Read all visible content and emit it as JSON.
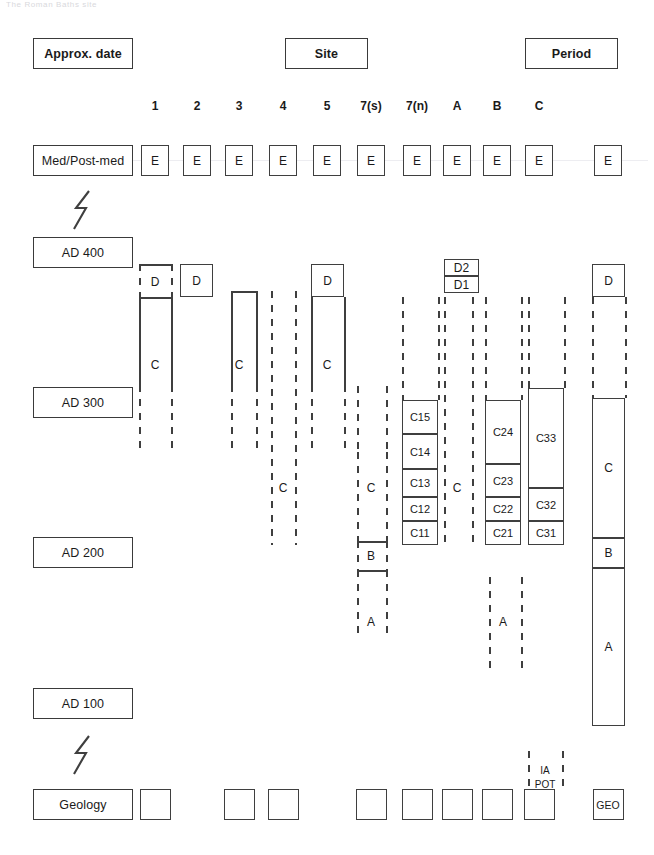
{
  "figure": {
    "ghost_caption": "The Roman Baths site",
    "header_boxes": [
      {
        "id": "approx-date",
        "label": "Approx. date",
        "x": 33,
        "y": 38,
        "w": 100,
        "h": 31
      },
      {
        "id": "site",
        "label": "Site",
        "x": 285,
        "y": 38,
        "w": 83,
        "h": 31
      },
      {
        "id": "period",
        "label": "Period",
        "x": 525,
        "y": 38,
        "w": 93,
        "h": 31
      }
    ],
    "column_headers": [
      {
        "id": "col-1",
        "label": "1",
        "cx": 155
      },
      {
        "id": "col-2",
        "label": "2",
        "cx": 197
      },
      {
        "id": "col-3",
        "label": "3",
        "cx": 239
      },
      {
        "id": "col-4",
        "label": "4",
        "cx": 283
      },
      {
        "id": "col-5",
        "label": "5",
        "cx": 327
      },
      {
        "id": "col-7s",
        "label": "7(s)",
        "cx": 371
      },
      {
        "id": "col-7n",
        "label": "7(n)",
        "cx": 417
      },
      {
        "id": "col-a",
        "label": "A",
        "cx": 457
      },
      {
        "id": "col-b",
        "label": "B",
        "cx": 497
      },
      {
        "id": "col-c",
        "label": "C",
        "cx": 539
      }
    ],
    "date_boxes": [
      {
        "id": "med-post-med",
        "label": "Med/Post-med",
        "x": 33,
        "y": 145,
        "w": 100,
        "h": 31
      },
      {
        "id": "ad-400",
        "label": "AD 400",
        "x": 33,
        "y": 237,
        "w": 100,
        "h": 31
      },
      {
        "id": "ad-300",
        "label": "AD 300",
        "x": 33,
        "y": 387,
        "w": 100,
        "h": 31
      },
      {
        "id": "ad-200",
        "label": "AD 200",
        "x": 33,
        "y": 537,
        "w": 100,
        "h": 31
      },
      {
        "id": "ad-100",
        "label": "AD 100",
        "x": 33,
        "y": 688,
        "w": 100,
        "h": 31
      },
      {
        "id": "geology",
        "label": "Geology",
        "x": 33,
        "y": 789,
        "w": 100,
        "h": 31
      }
    ],
    "hiatus_marks": [
      {
        "id": "hiatus-upper",
        "x": 72,
        "y": 190,
        "w": 22,
        "h": 40
      },
      {
        "id": "hiatus-lower",
        "x": 72,
        "y": 735,
        "w": 22,
        "h": 40
      }
    ],
    "e_row": {
      "label": "E",
      "y": 145,
      "h": 31,
      "w": 28,
      "boxes": [
        {
          "id": "e-col-1",
          "cx": 155
        },
        {
          "id": "e-col-2",
          "cx": 197
        },
        {
          "id": "e-col-3",
          "cx": 239
        },
        {
          "id": "e-col-4",
          "cx": 283
        },
        {
          "id": "e-col-5",
          "cx": 327
        },
        {
          "id": "e-col-7s",
          "cx": 371
        },
        {
          "id": "e-col-7n",
          "cx": 417
        },
        {
          "id": "e-col-a",
          "cx": 457
        },
        {
          "id": "e-col-b",
          "cx": 497
        },
        {
          "id": "e-col-c",
          "cx": 539
        },
        {
          "id": "e-period",
          "cx": 608
        }
      ]
    },
    "geology_row": {
      "y": 789,
      "h": 31,
      "w": 31,
      "boxes": [
        {
          "id": "geo-col-1",
          "cx": 155,
          "label": ""
        },
        {
          "id": "geo-col-3",
          "cx": 239,
          "label": ""
        },
        {
          "id": "geo-col-4",
          "cx": 283,
          "label": ""
        },
        {
          "id": "geo-col-7s",
          "cx": 371,
          "label": ""
        },
        {
          "id": "geo-col-7n",
          "cx": 417,
          "label": ""
        },
        {
          "id": "geo-col-a",
          "cx": 457,
          "label": ""
        },
        {
          "id": "geo-col-b",
          "cx": 497,
          "label": ""
        },
        {
          "id": "geo-col-c",
          "cx": 539,
          "label": ""
        },
        {
          "id": "geo-period",
          "cx": 608,
          "label": "GEO"
        }
      ]
    },
    "unit_boxes": [
      {
        "id": "d-col-2",
        "label": "D",
        "x": 180,
        "y": 264,
        "w": 33,
        "h": 33
      },
      {
        "id": "d-col-5",
        "label": "D",
        "x": 311,
        "y": 264,
        "w": 33,
        "h": 33
      },
      {
        "id": "d2-col-a",
        "label": "D2",
        "x": 444,
        "y": 259,
        "w": 35,
        "h": 17
      },
      {
        "id": "d1-col-a",
        "label": "D1",
        "x": 444,
        "y": 276,
        "w": 35,
        "h": 17
      },
      {
        "id": "d-period",
        "label": "D",
        "x": 592,
        "y": 264,
        "w": 33,
        "h": 33
      },
      {
        "id": "c15-col-7n",
        "label": "C15",
        "x": 402,
        "y": 400,
        "w": 36,
        "h": 34
      },
      {
        "id": "c14-col-7n",
        "label": "C14",
        "x": 402,
        "y": 434,
        "w": 36,
        "h": 35
      },
      {
        "id": "c13-col-7n",
        "label": "C13",
        "x": 402,
        "y": 469,
        "w": 36,
        "h": 28
      },
      {
        "id": "c12-col-7n",
        "label": "C12",
        "x": 402,
        "y": 497,
        "w": 36,
        "h": 24
      },
      {
        "id": "c11-col-7n",
        "label": "C11",
        "x": 402,
        "y": 521,
        "w": 36,
        "h": 24
      },
      {
        "id": "c24-col-b",
        "label": "C24",
        "x": 485,
        "y": 400,
        "w": 36,
        "h": 64
      },
      {
        "id": "c23-col-b",
        "label": "C23",
        "x": 485,
        "y": 464,
        "w": 36,
        "h": 33
      },
      {
        "id": "c22-col-b",
        "label": "C22",
        "x": 485,
        "y": 497,
        "w": 36,
        "h": 24
      },
      {
        "id": "c21-col-b",
        "label": "C21",
        "x": 485,
        "y": 521,
        "w": 36,
        "h": 24
      },
      {
        "id": "c33-col-c",
        "label": "C33",
        "x": 528,
        "y": 388,
        "w": 36,
        "h": 100
      },
      {
        "id": "c32-col-c",
        "label": "C32",
        "x": 528,
        "y": 488,
        "w": 36,
        "h": 33
      },
      {
        "id": "c31-col-c",
        "label": "C31",
        "x": 528,
        "y": 521,
        "w": 36,
        "h": 24
      },
      {
        "id": "c-period",
        "label": "C",
        "x": 592,
        "y": 398,
        "w": 33,
        "h": 140
      },
      {
        "id": "b-period",
        "label": "B",
        "x": 592,
        "y": 538,
        "w": 33,
        "h": 30
      },
      {
        "id": "a-period",
        "label": "A",
        "x": 592,
        "y": 568,
        "w": 33,
        "h": 158
      }
    ],
    "open_columns": [
      {
        "id": "d-col-1",
        "label": "D",
        "label_x": 155,
        "label_y": 282,
        "left": 139,
        "right": 171,
        "top": 264,
        "bottom": 297,
        "left_style": "dashed",
        "right_style": "dashed",
        "top_style": "solid",
        "bottom_style": "solid"
      },
      {
        "id": "c-col-1",
        "label": "C",
        "label_x": 155,
        "label_y": 365,
        "left": 139,
        "right": 171,
        "top": 297,
        "bottom": 452,
        "left_style": "solid-then-dashed",
        "right_style": "solid-then-dashed",
        "split": 385,
        "top_style": "none",
        "bottom_style": "none"
      },
      {
        "id": "c-col-3",
        "label": "C",
        "label_x": 239,
        "label_y": 365,
        "left": 231,
        "right": 256,
        "top": 291,
        "bottom": 452,
        "left_style": "solid-then-dashed",
        "right_style": "solid-then-dashed",
        "split": 385,
        "top_style": "solid",
        "bottom_style": "none"
      },
      {
        "id": "c-col-4",
        "label": "C",
        "label_x": 283,
        "label_y": 488,
        "left": 271,
        "right": 295,
        "top": 291,
        "bottom": 545,
        "left_style": "dashed",
        "right_style": "dashed",
        "top_style": "none",
        "bottom_style": "none"
      },
      {
        "id": "c-col-5",
        "label": "C",
        "label_x": 327,
        "label_y": 365,
        "left": 311,
        "right": 344,
        "top": 297,
        "bottom": 452,
        "left_style": "solid-then-dashed",
        "right_style": "solid-then-dashed",
        "split": 385,
        "top_style": "none",
        "bottom_style": "none"
      },
      {
        "id": "c-col-7s",
        "label": "C",
        "label_x": 371,
        "label_y": 488,
        "left": 357,
        "right": 386,
        "top": 452,
        "bottom": 541,
        "left_style": "dashed",
        "right_style": "dashed",
        "top_style": "none",
        "bottom_style": "none"
      },
      {
        "id": "c-upper-col-7s",
        "label": "",
        "label_x": 0,
        "label_y": 0,
        "left": 357,
        "right": 386,
        "top": 386,
        "bottom": 452,
        "left_style": "dashed",
        "right_style": "dashed",
        "top_style": "none",
        "bottom_style": "none"
      },
      {
        "id": "b-col-7s",
        "label": "B",
        "label_x": 371,
        "label_y": 556,
        "left": 357,
        "right": 386,
        "top": 541,
        "bottom": 570,
        "left_style": "dashed",
        "right_style": "dashed",
        "top_style": "solid",
        "bottom_style": "solid"
      },
      {
        "id": "a-col-7s",
        "label": "A",
        "label_x": 371,
        "label_y": 622,
        "left": 357,
        "right": 386,
        "top": 570,
        "bottom": 638,
        "left_style": "dashed",
        "right_style": "dashed",
        "top_style": "none",
        "bottom_style": "none"
      },
      {
        "id": "c-col-7n-upper",
        "label": "",
        "label_x": 0,
        "label_y": 0,
        "left": 402,
        "right": 438,
        "top": 297,
        "bottom": 400,
        "left_style": "dashed",
        "right_style": "dashed",
        "top_style": "none",
        "bottom_style": "none"
      },
      {
        "id": "c-col-a",
        "label": "C",
        "label_x": 457,
        "label_y": 488,
        "left": 444,
        "right": 472,
        "top": 297,
        "bottom": 545,
        "left_style": "dashed",
        "right_style": "dashed",
        "top_style": "none",
        "bottom_style": "none"
      },
      {
        "id": "c-col-b-upper",
        "label": "",
        "label_x": 0,
        "label_y": 0,
        "left": 485,
        "right": 521,
        "top": 297,
        "bottom": 400,
        "left_style": "dashed",
        "right_style": "dashed",
        "top_style": "none",
        "bottom_style": "none"
      },
      {
        "id": "c-col-c-upper",
        "label": "",
        "label_x": 0,
        "label_y": 0,
        "left": 528,
        "right": 564,
        "top": 297,
        "bottom": 388,
        "left_style": "dashed",
        "right_style": "dashed",
        "top_style": "none",
        "bottom_style": "none"
      },
      {
        "id": "a-col-b",
        "label": "A",
        "label_x": 503,
        "label_y": 622,
        "left": 489,
        "right": 521,
        "top": 577,
        "bottom": 675,
        "left_style": "dashed",
        "right_style": "dashed",
        "top_style": "none",
        "bottom_style": "none"
      },
      {
        "id": "c-period-gap",
        "label": "",
        "label_x": 0,
        "label_y": 0,
        "left": 592,
        "right": 625,
        "top": 297,
        "bottom": 398,
        "left_style": "dashed",
        "right_style": "dashed",
        "top_style": "none",
        "bottom_style": "none"
      },
      {
        "id": "ia-pot-col-c",
        "label": "",
        "label_x": 0,
        "label_y": 0,
        "left": 528,
        "right": 562,
        "top": 751,
        "bottom": 789,
        "left_style": "dashed",
        "right_style": "dashed",
        "top_style": "none",
        "bottom_style": "none"
      }
    ],
    "ia_pot": {
      "ia_label": "IA",
      "pot_label": "POT",
      "ia_x": 545,
      "ia_y": 770,
      "pot_x": 545,
      "pot_y": 784
    }
  }
}
